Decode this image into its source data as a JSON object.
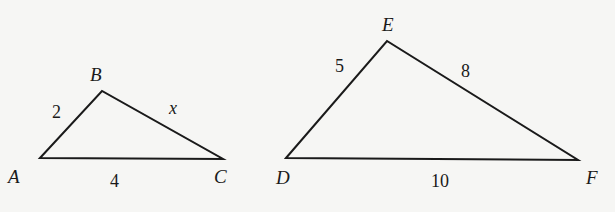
{
  "diagram": {
    "stroke_color": "#1a1a1a",
    "background_color": "#f6f6f4",
    "triangles": [
      {
        "name": "ABC",
        "vertices": [
          {
            "label": "A",
            "x": 40,
            "y": 158
          },
          {
            "label": "B",
            "x": 102,
            "y": 91
          },
          {
            "label": "C",
            "x": 223,
            "y": 159
          }
        ],
        "sides": [
          {
            "between": "AB",
            "label": "2"
          },
          {
            "between": "BC",
            "label": "x"
          },
          {
            "between": "AC",
            "label": "4"
          }
        ]
      },
      {
        "name": "DEF",
        "vertices": [
          {
            "label": "D",
            "x": 286,
            "y": 158
          },
          {
            "label": "E",
            "x": 387,
            "y": 41
          },
          {
            "label": "F",
            "x": 578,
            "y": 160
          }
        ],
        "sides": [
          {
            "between": "DE",
            "label": "5"
          },
          {
            "between": "EF",
            "label": "8"
          },
          {
            "between": "DF",
            "label": "10"
          }
        ]
      }
    ]
  }
}
